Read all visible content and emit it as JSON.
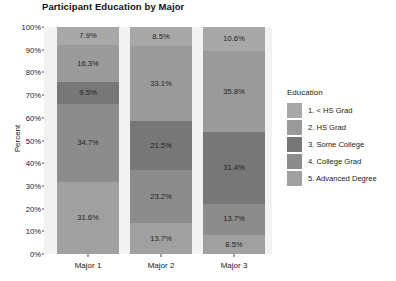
{
  "chart_data": {
    "type": "bar",
    "subtype": "stacked-percent",
    "title": "Participant Education by Major",
    "xlabel": "",
    "ylabel": "Percent",
    "categories": [
      "Major 1",
      "Major 2",
      "Major 3"
    ],
    "ylim": [
      0,
      100
    ],
    "ytick_labels": [
      "0%",
      "10%",
      "20%",
      "30%",
      "40%",
      "50%",
      "60%",
      "70%",
      "80%",
      "90%",
      "100%"
    ],
    "ytick_values": [
      0,
      10,
      20,
      30,
      40,
      50,
      60,
      70,
      80,
      90,
      100
    ],
    "grid": false,
    "legend_position": "right",
    "legend_title": "Education",
    "stack_order": "bottom-to-top: 5,4,3,2,1",
    "series": [
      {
        "name": "1. < HS Grad",
        "color": "#a8a8a8",
        "values": [
          7.9,
          8.5,
          10.6
        ],
        "labels": [
          "7.9%",
          "8.5%",
          "10.6%"
        ]
      },
      {
        "name": "2. HS Grad",
        "color": "#9a9a9a",
        "values": [
          16.3,
          33.1,
          35.8
        ],
        "labels": [
          "16.3%",
          "33.1%",
          "35.8%"
        ]
      },
      {
        "name": "3. Some College",
        "color": "#777777",
        "values": [
          9.5,
          21.5,
          31.4
        ],
        "labels": [
          "9.5%",
          "21.5%",
          "31.4%"
        ]
      },
      {
        "name": "4. College Grad",
        "color": "#8c8c8c",
        "values": [
          34.7,
          23.2,
          13.7
        ],
        "labels": [
          "34.7%",
          "23.2%",
          "13.7%"
        ]
      },
      {
        "name": "5. Advanced Degree",
        "color": "#a0a0a0",
        "values": [
          31.6,
          13.7,
          8.5
        ],
        "labels": [
          "31.6%",
          "13.7%",
          "8.5%"
        ]
      }
    ]
  },
  "panel": {
    "background_color": "#f2f2f2"
  }
}
